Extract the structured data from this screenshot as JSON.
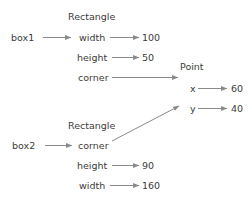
{
  "diagram": {
    "kind": "object-state-diagram",
    "colors": {
      "text": "#3b3b3b",
      "arrow": "#8a8a8a",
      "background": "#ffffff"
    },
    "variables": [
      {
        "name": "box1"
      },
      {
        "name": "box2"
      }
    ],
    "objects": [
      {
        "id": "rect1",
        "type_label": "Rectangle",
        "attributes": [
          {
            "key": "width",
            "value": "100"
          },
          {
            "key": "height",
            "value": "50"
          },
          {
            "key": "corner",
            "value": "",
            "reference": "point"
          }
        ]
      },
      {
        "id": "rect2",
        "type_label": "Rectangle",
        "attributes": [
          {
            "key": "corner",
            "value": "",
            "reference": "point"
          },
          {
            "key": "height",
            "value": "90"
          },
          {
            "key": "width",
            "value": "160"
          }
        ]
      },
      {
        "id": "point",
        "type_label": "Point",
        "attributes": [
          {
            "key": "x",
            "value": "60"
          },
          {
            "key": "y",
            "value": "40"
          }
        ]
      }
    ]
  }
}
